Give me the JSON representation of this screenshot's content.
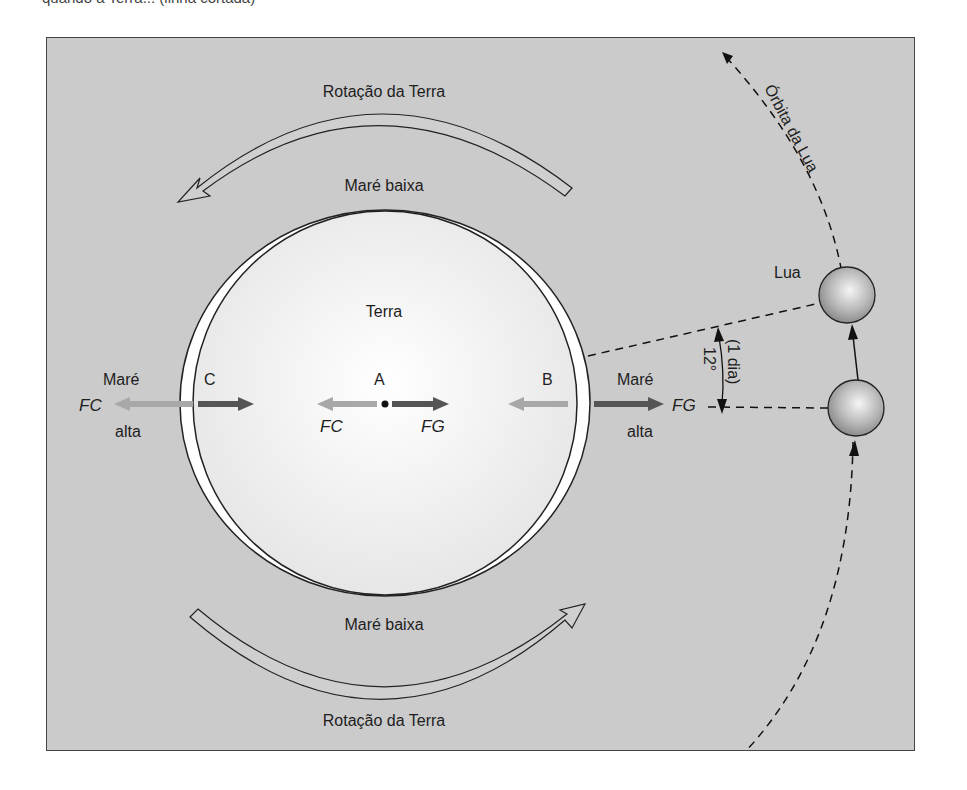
{
  "top_text_fragment": "quando a Terra... (linha cortada)",
  "diagram": {
    "rotation_top_label": "Rotação da Terra",
    "rotation_bottom_label": "Rotação da Terra",
    "low_tide_top": "Maré baixa",
    "low_tide_bottom": "Maré baixa",
    "earth_label": "Terra",
    "high_tide_left": {
      "line1": "Maré",
      "line2": "alta",
      "force": "FC"
    },
    "high_tide_right": {
      "line1": "Maré",
      "line2": "alta",
      "force": "FG"
    },
    "point_c": "C",
    "point_a": "A",
    "point_b": "B",
    "center_fc": "FC",
    "center_fg": "FG",
    "moon_label": "Lua",
    "orbit_label": "Órbita da Lua",
    "angle_label": "12°",
    "angle_note": "(1 dia)"
  },
  "colors": {
    "background": "#cbcbcb",
    "earth_fill": "#f2f2f2",
    "bulge_fill": "#ffffff",
    "fc_arrow": "#a8a8a8",
    "fg_arrow": "#555555",
    "moon": "#a9a9a9"
  }
}
